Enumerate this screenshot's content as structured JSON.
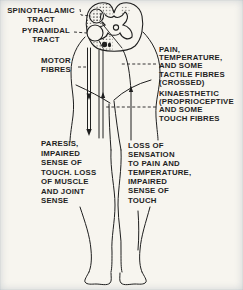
{
  "colors": {
    "paper": "#f7f5ef",
    "ink": "#1f1f1f"
  },
  "diagram": {
    "type": "anatomical-line-drawing",
    "labels": {
      "spinothalamic_tract": "SPINOTHALAMIC\nTRACT",
      "pyramidal_tract": "PYRAMIDAL\nTRACT",
      "motor_fibres": "MOTOR\nFIBRES",
      "pain_temperature": "PAIN,\nTEMPERATURE,\nAND SOME\nTACTILE FIBRES\n(CROSSED)",
      "kinaesthetic": "KINAESTHETIC\n(PROPRIOCEPTIVE\nAND SOME\nTOUCH FIBRES",
      "paresis": "PARESIS,\nIMPAIRED\nSENSE OF\nTOUCH. LOSS\nOF MUSCLE\nAND JOINT\nSENSE",
      "loss_of_sensation": "LOSS OF\nSENSATION\nTO PAIN AND\nTEMPERATURE,\nIMPAIRED\nSENSE OF\nTOUCH"
    }
  }
}
